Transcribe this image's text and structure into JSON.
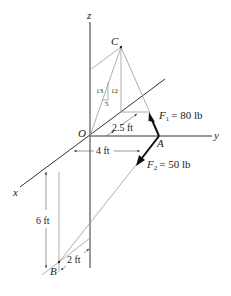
{
  "axes": {
    "x_label": "x",
    "y_label": "y",
    "z_label": "z"
  },
  "points": {
    "origin": "O",
    "A": "A",
    "B": "B",
    "C": "C"
  },
  "forces": {
    "F1": {
      "symbol": "F",
      "subscript": "1",
      "value": "= 80 lb"
    },
    "F2": {
      "symbol": "F",
      "subscript": "2",
      "value": "= 50 lb"
    }
  },
  "slope_triangle": {
    "hyp": "13",
    "vert": "12",
    "horiz": "5"
  },
  "dimensions": {
    "d_2_5": "2.5 ft",
    "d_4": "4 ft",
    "d_6": "6 ft",
    "d_2": "2 ft"
  },
  "colors": {
    "axis": "#333333",
    "construction": "#9a9a9a",
    "force_arrow": "#111111"
  }
}
